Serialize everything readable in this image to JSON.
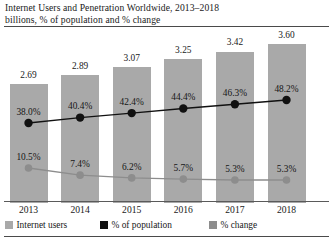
{
  "header": {
    "title": "Internet Users and Penetration Worldwide, 2013–2018",
    "subtitle": "billions, % of population and % change"
  },
  "chart_data": {
    "type": "bar",
    "title": "Internet Users and Penetration Worldwide, 2013–2018",
    "subtitle": "billions, % of population and % change",
    "xlabel": "",
    "ylabel": "",
    "grid": false,
    "legend_position": "bottom",
    "categories": [
      "2013",
      "2014",
      "2015",
      "2016",
      "2017",
      "2018"
    ],
    "series": [
      {
        "name": "Internet users",
        "type": "bar",
        "unit": "billions",
        "color": "#a9a9a9",
        "values": [
          2.69,
          2.89,
          3.07,
          3.25,
          3.42,
          3.6
        ],
        "labels": [
          "2.69",
          "2.89",
          "3.07",
          "3.25",
          "3.42",
          "3.60"
        ]
      },
      {
        "name": "% of population",
        "type": "line",
        "unit": "percent",
        "color": "#111111",
        "values": [
          38.0,
          40.4,
          42.4,
          44.4,
          46.3,
          48.2
        ],
        "labels": [
          "38.0%",
          "40.4%",
          "42.4%",
          "44.4%",
          "46.3%",
          "48.2%"
        ]
      },
      {
        "name": "% change",
        "type": "line",
        "unit": "percent",
        "color": "#8d8d8d",
        "values": [
          10.5,
          7.4,
          6.2,
          5.7,
          5.3,
          5.3
        ],
        "labels": [
          "10.5%",
          "7.4%",
          "6.2%",
          "5.7%",
          "5.3%",
          "5.3%"
        ]
      }
    ]
  },
  "legend": {
    "items": [
      {
        "label": "Internet users",
        "color": "#a9a9a9"
      },
      {
        "label": "% of population",
        "color": "#111111"
      },
      {
        "label": "% change",
        "color": "#8d8d8d"
      }
    ]
  },
  "colors": {
    "bar": "#a9a9a9",
    "line_population": "#111111",
    "line_change": "#8d8d8d",
    "rule": "#4a4a4a",
    "text": "#1a1a1a"
  }
}
